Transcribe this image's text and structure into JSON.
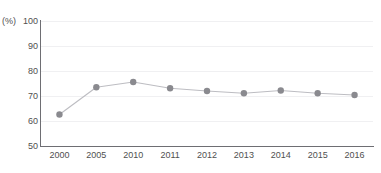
{
  "chart_data": {
    "type": "line",
    "title": "",
    "xlabel": "",
    "ylabel": "",
    "unit_label": "(%)",
    "categories": [
      "2000",
      "2005",
      "2010",
      "2011",
      "2012",
      "2013",
      "2014",
      "2015",
      "2016"
    ],
    "values": [
      62.6,
      73.5,
      75.6,
      73.1,
      72.0,
      71.1,
      72.2,
      71.1,
      70.4
    ],
    "series": [
      {
        "name": "",
        "values": [
          62.6,
          73.5,
          75.6,
          73.1,
          72.0,
          71.1,
          72.2,
          71.1,
          70.4
        ]
      }
    ],
    "ylim": [
      50,
      100
    ],
    "yticks": [
      100,
      90,
      80,
      70,
      60,
      50
    ],
    "ytick_labels": [
      "100",
      "90",
      "80",
      "70",
      "60",
      "50"
    ],
    "grid": true,
    "grid_axis": "y",
    "legend": false,
    "legend_position": "none",
    "marker": "circle",
    "colors": {
      "marker": "#8a8a8f",
      "line": "#bdbdc2",
      "grid": "#f0f0f2",
      "axis": "#6e6e73",
      "text": "#4f4f4f",
      "background": "#ffffff"
    }
  },
  "title_sliver": {
    "text": ""
  }
}
